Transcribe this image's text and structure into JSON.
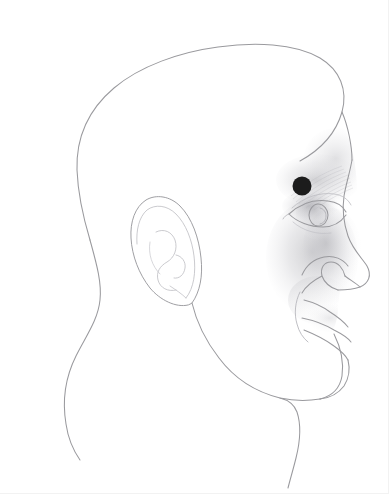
{
  "figure": {
    "orientation": "right-facing profile",
    "background_color": "#ffffff",
    "line_color": "#9a9a9e",
    "shading_color": "#b8b8bc",
    "canvas": {
      "width": 389,
      "height": 494
    }
  },
  "anatomy": {
    "skull_label": "cranium-outline",
    "face_label": "face-profile-outline",
    "ear_label": "ear-outline",
    "eye_label": "eye-outline",
    "eyebrow_label": "eyebrow-ridge",
    "nose_label": "nose-profile",
    "nostril_label": "nostril",
    "lips_label": "lips-outline",
    "chin_label": "chin-jawline",
    "neck_label": "neck-outline",
    "cheek_shading_label": "cheek-shading",
    "brow_shading_label": "brow-shading"
  },
  "markers": [
    {
      "id": "marker-1",
      "name": "injection-site-marker",
      "cx": 302,
      "cy": 186,
      "r": 9.5,
      "color": "#1c1c1c",
      "region": "medial eyebrow / glabella"
    }
  ],
  "accessibility": {
    "alt_text": "Line drawing of a human head in right-facing profile with a single black dot marking a point at the medial end of the eyebrow above the inner corner of the eye."
  }
}
